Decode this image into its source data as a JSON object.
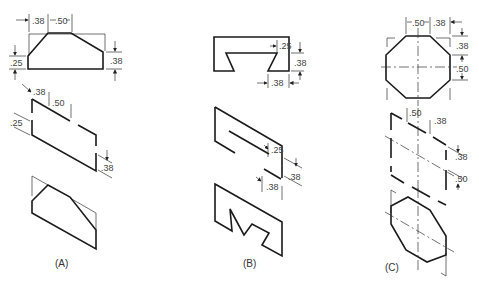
{
  "figure": {
    "panels": [
      {
        "id": "A",
        "label": "(A)",
        "top_view_dims": {
          "left_offset": ".38",
          "top_width": ".50",
          "left_height": ".25",
          "right_height": ".38"
        },
        "iso_dims": {
          "left_offset": ".38",
          "top_width": ".50",
          "left_height": ".25",
          "right_height": ".38"
        }
      },
      {
        "id": "B",
        "label": "(B)",
        "top_view_dims": {
          "notch_depth": ".25",
          "right_height": ".38",
          "bottom_width": ".38"
        },
        "iso_dims": {
          "notch_depth": ".25",
          "right_height": ".38",
          "bottom_width": ".38"
        }
      },
      {
        "id": "C",
        "label": "(C)",
        "top_view_dims": {
          "top_width": ".50",
          "right_offset": ".38",
          "upper_height": ".38",
          "middle_height": ".50"
        },
        "iso_dims": {
          "top_width": ".50",
          "right_offset": ".38",
          "upper_height": ".38",
          "middle_height": ".50"
        }
      }
    ]
  }
}
